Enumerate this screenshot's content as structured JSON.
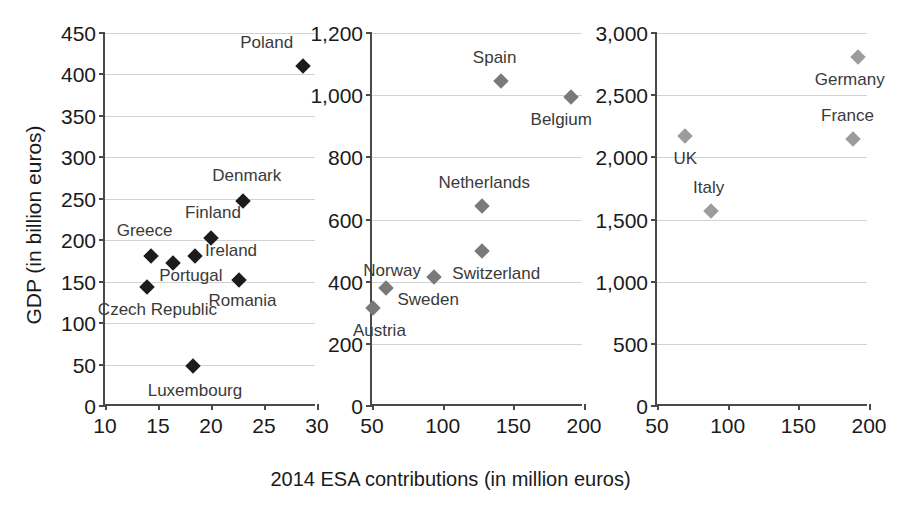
{
  "axis_titles": {
    "y": "GDP (in billion euros)",
    "x": "2014 ESA contributions (in million euros)"
  },
  "colors": {
    "panel1_marker": "#1c1c1c",
    "panel2_marker": "#7a7a7a",
    "panel3_marker": "#9c9c9c",
    "axis": "#4a4a4a",
    "grid": "#d2d2d2",
    "text": "#1a1a1a"
  },
  "chart_data": {
    "type": "scatter",
    "title": "",
    "xlabel": "2014 ESA contributions (in million euros)",
    "ylabel": "GDP (in billion euros)",
    "grid": true,
    "legend": "none",
    "panels": [
      {
        "name": "panel-low",
        "xlim": [
          10,
          30
        ],
        "ylim": [
          0,
          450
        ],
        "xticks": [
          10,
          15,
          20,
          25,
          30
        ],
        "xtick_labels": [
          "10",
          "15",
          "20",
          "25",
          "30"
        ],
        "yticks": [
          0,
          50,
          100,
          150,
          200,
          250,
          300,
          350,
          400,
          450
        ],
        "ytick_labels": [
          "0",
          "50",
          "100",
          "150",
          "200",
          "250",
          "300",
          "350",
          "400",
          "450"
        ],
        "points": [
          {
            "label": "Poland",
            "x": 28.7,
            "y": 410,
            "label_dx": -10,
            "label_dy": -24,
            "label_anchor": "end"
          },
          {
            "label": "Denmark",
            "x": 23.0,
            "y": 247,
            "label_dx": 4,
            "label_dy": -26,
            "label_anchor": "middle"
          },
          {
            "label": "Finland",
            "x": 20.0,
            "y": 203,
            "label_dx": 2,
            "label_dy": -26,
            "label_anchor": "middle"
          },
          {
            "label": "Ireland",
            "x": 18.5,
            "y": 181,
            "label_dx": 10,
            "label_dy": -6,
            "label_anchor": "start"
          },
          {
            "label": "Greece",
            "x": 14.3,
            "y": 181,
            "label_dx": -6,
            "label_dy": -26,
            "label_anchor": "middle"
          },
          {
            "label": "Portugal",
            "x": 16.4,
            "y": 172,
            "label_dx": 18,
            "label_dy": 12,
            "label_anchor": "middle"
          },
          {
            "label": "Romania",
            "x": 22.6,
            "y": 152,
            "label_dx": 4,
            "label_dy": 20,
            "label_anchor": "middle"
          },
          {
            "label": "Czech Republic",
            "x": 14.0,
            "y": 143,
            "label_dx": 10,
            "label_dy": 22,
            "label_anchor": "middle"
          },
          {
            "label": "Luxembourg",
            "x": 18.3,
            "y": 48,
            "label_dx": 2,
            "label_dy": 24,
            "label_anchor": "middle"
          }
        ]
      },
      {
        "name": "panel-mid",
        "xlim": [
          50,
          200
        ],
        "ylim": [
          0,
          1200
        ],
        "xticks": [
          50,
          100,
          150,
          200
        ],
        "xtick_labels": [
          "50",
          "100",
          "150",
          "200"
        ],
        "yticks": [
          0,
          200,
          400,
          600,
          800,
          1000,
          1200
        ],
        "ytick_labels": [
          "0",
          "200",
          "400",
          "600",
          "800",
          "1,000",
          "1,200"
        ],
        "points": [
          {
            "label": "Spain",
            "x": 141,
            "y": 1045,
            "label_dx": -6,
            "label_dy": -24,
            "label_anchor": "middle"
          },
          {
            "label": "Netherlands",
            "x": 128,
            "y": 645,
            "label_dx": 2,
            "label_dy": -24,
            "label_anchor": "middle"
          },
          {
            "label": "Switzerland",
            "x": 128,
            "y": 500,
            "label_dx": 14,
            "label_dy": 22,
            "label_anchor": "middle"
          },
          {
            "label": "Sweden",
            "x": 94,
            "y": 415,
            "label_dx": -6,
            "label_dy": 22,
            "label_anchor": "middle"
          },
          {
            "label": "Norway",
            "x": 60,
            "y": 380,
            "label_dx": 6,
            "label_dy": -18,
            "label_anchor": "middle"
          },
          {
            "label": "Austria",
            "x": 51,
            "y": 315,
            "label_dx": 6,
            "label_dy": 22,
            "label_anchor": "middle"
          },
          {
            "label": "Belgium",
            "x": 191,
            "y": 995,
            "label_dx": -10,
            "label_dy": 22,
            "label_anchor": "middle"
          }
        ]
      },
      {
        "name": "panel-high",
        "xlim": [
          50,
          200
        ],
        "ylim": [
          0,
          3000
        ],
        "xticks": [
          50,
          100,
          150,
          200
        ],
        "xtick_labels": [
          "50",
          "100",
          "150",
          "200"
        ],
        "yticks": [
          0,
          500,
          1000,
          1500,
          2000,
          2500,
          3000
        ],
        "ytick_labels": [
          "0",
          "500",
          "1,000",
          "1,500",
          "2,000",
          "2,500",
          "3,000"
        ],
        "points": [
          {
            "label": "Germany",
            "x": 192,
            "y": 2810,
            "label_dx": -8,
            "label_dy": 22,
            "label_anchor": "middle"
          },
          {
            "label": "France",
            "x": 189,
            "y": 2150,
            "label_dx": -6,
            "label_dy": -24,
            "label_anchor": "middle"
          },
          {
            "label": "UK",
            "x": 70,
            "y": 2170,
            "label_dx": 0,
            "label_dy": 22,
            "label_anchor": "middle"
          },
          {
            "label": "Italy",
            "x": 88,
            "y": 1570,
            "label_dx": -2,
            "label_dy": -24,
            "label_anchor": "middle"
          }
        ]
      }
    ]
  }
}
